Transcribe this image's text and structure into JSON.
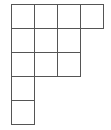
{
  "diagram": {
    "type": "young-diagram",
    "row_lengths": [
      4,
      3,
      3,
      1,
      1
    ],
    "origin": {
      "x": 11,
      "y": 4
    },
    "cell_width": 23,
    "cell_height": 24,
    "line_color": "#555555",
    "fill_color": "#ffffff"
  }
}
